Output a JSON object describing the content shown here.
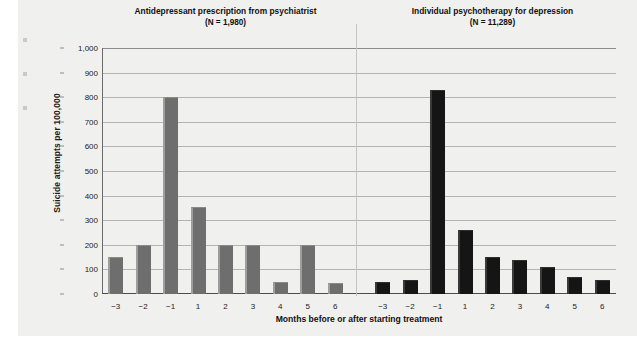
{
  "figure": {
    "background_color": "#f0f0ef",
    "y_axis_title": "Suicide attempts per 100,000",
    "x_axis_title": "Months before or after starting treatment"
  },
  "chart_data": {
    "type": "bar",
    "title": "",
    "xlabel": "Months before or after starting treatment",
    "ylabel": "Suicide attempts per 100,000",
    "ylim": [
      0,
      1000
    ],
    "yticks": [
      0,
      100,
      200,
      300,
      400,
      500,
      600,
      700,
      800,
      900,
      1000
    ],
    "ytick_labels": [
      "0",
      "100",
      "200",
      "300",
      "400",
      "500",
      "600",
      "700",
      "800",
      "900",
      "1,000"
    ],
    "categories": [
      "−3",
      "−2",
      "−1",
      "1",
      "2",
      "3",
      "4",
      "5",
      "6"
    ],
    "grid": true,
    "legend": "none",
    "panels": [
      {
        "title": "Antidepressant prescription from psychiatrist",
        "subtitle": "(N = 1,980)",
        "n": "1,980",
        "bar_color": "#6e6e6e",
        "values": [
          150,
          200,
          800,
          355,
          200,
          200,
          50,
          200,
          45
        ]
      },
      {
        "title": "Individual psychotherapy for depression",
        "subtitle": "(N = 11,289)",
        "n": "11,289",
        "bar_color": "#151515",
        "values": [
          50,
          55,
          830,
          260,
          150,
          140,
          110,
          70,
          55
        ]
      }
    ]
  }
}
